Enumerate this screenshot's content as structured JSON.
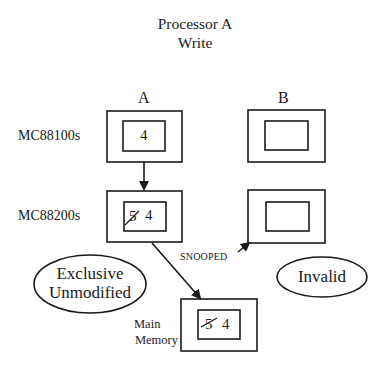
{
  "title": {
    "line1": "Processor A",
    "line2": "Write"
  },
  "columns": {
    "a": "A",
    "b": "B"
  },
  "rows": {
    "cpu": "MC88100s",
    "cmmu": "MC88200s"
  },
  "processor_a": {
    "mc88100_value": "4",
    "mc88200_old_value": "5",
    "mc88200_new_value": "4"
  },
  "processor_b": {
    "mc88100_value": "",
    "mc88200_value": ""
  },
  "main_memory": {
    "label_line1": "Main",
    "label_line2": "Memory",
    "old_value": "5",
    "new_value": "4"
  },
  "states": {
    "a": {
      "line1": "Exclusive",
      "line2": "Unmodified"
    },
    "b": "Invalid"
  },
  "bus_label": "SNOOPED",
  "colors": {
    "ink": "#1a1a1a",
    "background": "#ffffff"
  }
}
